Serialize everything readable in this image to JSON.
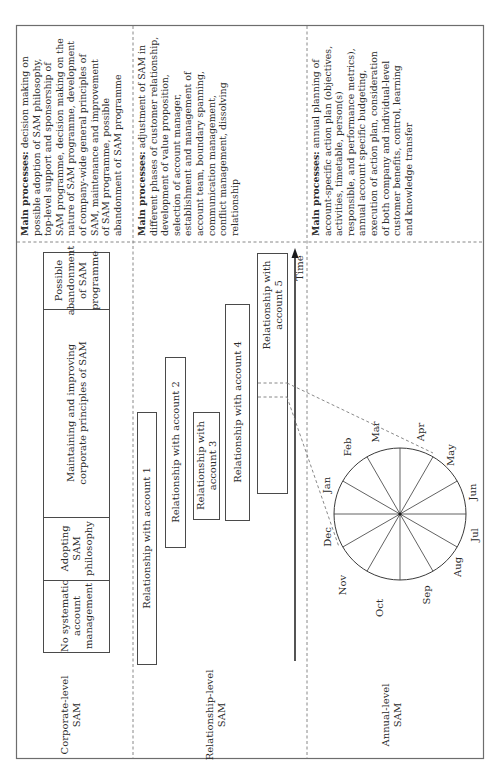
{
  "levels": [
    {
      "id": "corporate",
      "label_lines": [
        "Corporate-level",
        "SAM"
      ],
      "processes_heading": "Main processes:",
      "processes_lines": [
        " decision making on",
        "possible adoption of SAM philosophy,",
        "top-level support and sponsorship of",
        "SAM programme, decision making on the",
        "nature of SAM programme, development",
        "of company-wide general principles of",
        "SAM, maintenance and improvement",
        "of SAM programme, possible",
        "abandonment of SAM programme"
      ]
    },
    {
      "id": "relationship",
      "label_lines": [
        "Relationship-level",
        "SAM"
      ],
      "processes_heading": "Main processes:",
      "processes_lines": [
        " adjustment of SAM in",
        "different phases of customer relationship,",
        "development of value proposition,",
        "selection of account manager,",
        "establishment and management of",
        "account team, boundary spanning,",
        "communication management,",
        "conflict management, dissolving",
        "relationship"
      ]
    },
    {
      "id": "annual",
      "label_lines": [
        "Annual-level",
        "SAM"
      ],
      "processes_heading": "Main processes:",
      "processes_lines": [
        " annual planning of",
        "account-specific action plan (objectives,",
        "activities, timetable, person(s)",
        "responsible, and performance metrics),",
        "annual account specific budgeting,",
        "execution of action plan, consideration",
        "of both company and individual-level",
        "customer benefits, control, learning",
        "and knowledge transfer"
      ]
    }
  ],
  "corporate_phases": [
    {
      "lines": [
        "No systematic",
        "account",
        "management"
      ]
    },
    {
      "lines": [
        "Adopting",
        "SAM",
        "philosophy"
      ]
    },
    {
      "lines": [
        "Maintaining and improving",
        "corporate principles of SAM"
      ]
    },
    {
      "lines": [
        "Possible",
        "abandonment",
        "of SAM",
        "programme"
      ]
    }
  ],
  "relationships": [
    {
      "lines": [
        "Relationship with account 1"
      ]
    },
    {
      "lines": [
        "Relationship with account 2"
      ]
    },
    {
      "lines": [
        "Relationship with",
        "account 3"
      ]
    },
    {
      "lines": [
        "Relationship with account 4"
      ]
    },
    {
      "lines": [
        "Relationship with",
        "account 5"
      ]
    }
  ],
  "time_axis_label": "Time",
  "months": [
    "Jan",
    "Feb",
    "Mar",
    "Apr",
    "May",
    "Jun",
    "Jul",
    "Aug",
    "Sep",
    "Oct",
    "Nov",
    "Dec"
  ]
}
